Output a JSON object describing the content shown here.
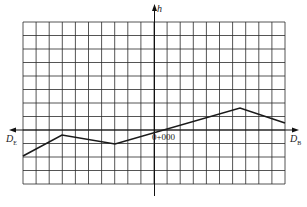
{
  "diagram": {
    "type": "longitudinal-profile",
    "axes": {
      "vertical_label": "h",
      "left_label": {
        "main": "D",
        "sub": "E"
      },
      "right_label": {
        "main": "D",
        "sub": "B"
      },
      "origin_label": "0+000"
    },
    "grid": {
      "columns": 20,
      "rows": 12
    },
    "profile_points": [
      [
        23,
        156
      ],
      [
        62,
        135
      ],
      [
        115,
        144
      ],
      [
        240,
        108
      ],
      [
        285,
        123
      ]
    ],
    "colors": {
      "line": "#1a1a1a",
      "grid": "#2a2a2a"
    }
  }
}
